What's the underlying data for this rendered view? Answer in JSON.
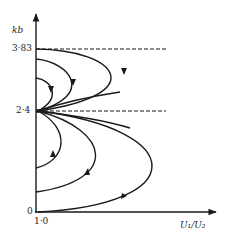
{
  "figure": {
    "y_axis_label": "kb",
    "x_axis_label": "U₁/U₂",
    "y_ticks": [
      {
        "label": "3·83",
        "value": 3.83
      },
      {
        "label": "2·4",
        "value": 2.4
      },
      {
        "label": "0",
        "value": 0
      }
    ],
    "x_ticks": [
      {
        "label": "1·0",
        "value": 1.0
      }
    ],
    "dashed_levels": [
      3.83,
      2.4
    ],
    "focal_point": {
      "x": 1.0,
      "y": 2.4
    },
    "colors": {
      "ink": "#1a1a1a",
      "background": "#ffffff"
    }
  },
  "curves": {
    "upper": [
      {
        "name": "upper-inner",
        "start_kb": 3.0,
        "end_kb": 2.4
      },
      {
        "name": "upper-middle",
        "start_kb": 3.6,
        "end_kb": 2.4
      },
      {
        "name": "upper-outer",
        "start_kb": 3.83,
        "end_kb": 2.4
      }
    ],
    "lower": [
      {
        "name": "lower-inner",
        "start_kb": 2.4,
        "end_kb": 1.0
      },
      {
        "name": "lower-middle",
        "start_kb": 2.4,
        "end_kb": 0.5
      },
      {
        "name": "lower-outer",
        "start_kb": 2.4,
        "end_kb": 0
      }
    ]
  }
}
